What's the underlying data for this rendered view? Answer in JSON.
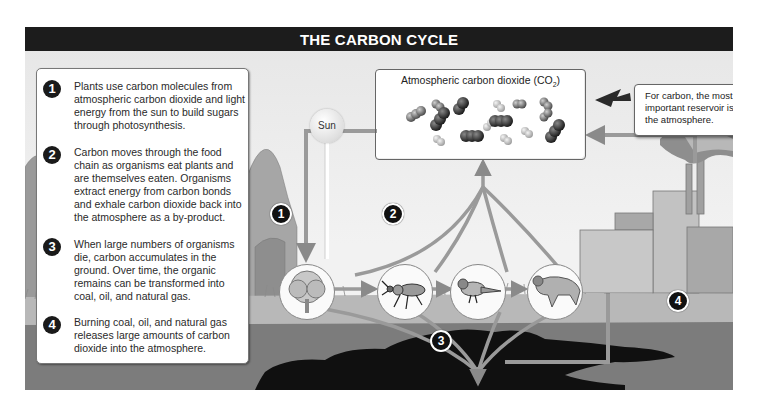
{
  "title": "THE CARBON CYCLE",
  "steps": [
    {
      "number": "1",
      "text": "Plants use carbon molecules from atmospheric carbon dioxide and light energy from the sun to build sugars through photosynthesis."
    },
    {
      "number": "2",
      "text": "Carbon moves through the food chain as organisms eat plants and are themselves eaten. Organisms extract energy from carbon bonds and exhale carbon dioxide back into the atmosphere as a by-product."
    },
    {
      "number": "3",
      "text": "When large numbers of organisms die, carbon accumulates in the ground. Over time, the organic remains can be transformed into coal, oil, and natural gas."
    },
    {
      "number": "4",
      "text": "Burning coal, oil, and natural gas releases large amounts of carbon dioxide into the atmosphere."
    }
  ],
  "atmosphere": {
    "label": "Atmospheric carbon dioxide (CO",
    "subscript": "2",
    "label_end": ")"
  },
  "callout": {
    "text": "For carbon, the most important reservoir is the atmosphere."
  },
  "sun": {
    "label": "Sun"
  },
  "diagram_badges": [
    {
      "number": "1",
      "location": "near tree"
    },
    {
      "number": "2",
      "location": "food chain arrows"
    },
    {
      "number": "3",
      "location": "underground deposits"
    },
    {
      "number": "4",
      "location": "factory"
    }
  ],
  "organisms": [
    "tree",
    "beetle",
    "bird",
    "wildcat"
  ],
  "colors": {
    "header_bg": "#1c1c1c",
    "panel_bg": "#eeeeee",
    "arrow": "#8c8c8c",
    "ground": "#7a7a7a",
    "grass": "#b0b0b0",
    "fossil_deposit": "#111111"
  }
}
